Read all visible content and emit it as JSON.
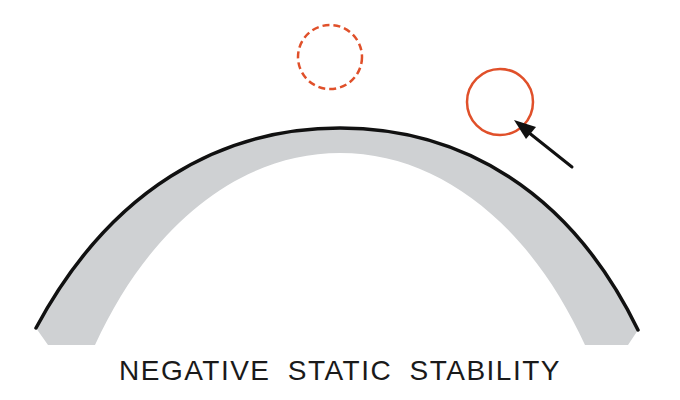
{
  "diagram": {
    "title": "NEGATIVE STATIC STABILITY",
    "colors": {
      "surface_fill": "#cfd1d3",
      "surface_outline": "#111111",
      "ball_color": "#e0502a",
      "arrow_color": "#111111",
      "background": "#ffffff"
    },
    "elements": {
      "hill": "convex curved surface (dome)",
      "ball_at_top": "dashed circle balanced on apex (equilibrium position)",
      "ball_displaced": "solid circle displaced down the right slope",
      "arrow": "arrow pointing toward displaced ball (disturbance / tendency to roll away)"
    }
  }
}
